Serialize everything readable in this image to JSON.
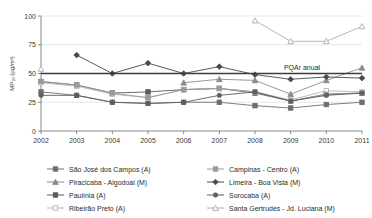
{
  "chart_data": {
    "type": "line",
    "title": "",
    "xlabel": "",
    "ylabel": "MP₁₀ (µg/m³)",
    "categories": [
      "2002",
      "2003",
      "2004",
      "2005",
      "2006",
      "2007",
      "2008",
      "2009",
      "2010",
      "2011"
    ],
    "x": [
      2002,
      2003,
      2004,
      2005,
      2006,
      2007,
      2008,
      2009,
      2010,
      2011
    ],
    "xlim": [
      2002,
      2011
    ],
    "ylim": [
      0,
      100
    ],
    "yticks": [
      0,
      25,
      50,
      75,
      100
    ],
    "xticks": [
      "2002",
      "2003",
      "2004",
      "2005",
      "2006",
      "2007",
      "2008",
      "2009",
      "2010",
      "2011"
    ],
    "grid": true,
    "legend_position": "bottom",
    "annotations": [
      {
        "text": "PQAr anual",
        "value": 50,
        "type": "horizontal-reference-line"
      }
    ],
    "series": [
      {
        "name": "São José dos Campos (A)",
        "marker": "square",
        "color": "#6e6e6e",
        "values": [
          34,
          31,
          25,
          24,
          25,
          25,
          22,
          20,
          23,
          25
        ]
      },
      {
        "name": "Piracicaba - Algodoal (M)",
        "marker": "triangle",
        "color": "#8c8c8c",
        "values": [
          null,
          null,
          null,
          null,
          42,
          45,
          44,
          32,
          44,
          55
        ]
      },
      {
        "name": "Paulínia (A)",
        "marker": "square",
        "color": "#5a5a5a",
        "values": [
          43,
          40,
          33,
          34,
          36,
          37,
          33,
          26,
          32,
          33
        ]
      },
      {
        "name": "Ribeirão Preto (A)",
        "marker": "square-open",
        "color": "#b5b5b5",
        "values": [
          42,
          39,
          32,
          29,
          36,
          37,
          34,
          27,
          35,
          34
        ]
      },
      {
        "name": "Campinas - Centro (A)",
        "marker": "square",
        "color": "#9a9a9a",
        "values": [
          43,
          40,
          33,
          29,
          36,
          37,
          34,
          26,
          32,
          33
        ]
      },
      {
        "name": "Limeira - Boa Vista (M)",
        "marker": "diamond",
        "color": "#4a4a4a",
        "values": [
          null,
          66,
          50,
          59,
          50,
          56,
          49,
          45,
          47,
          46
        ]
      },
      {
        "name": "Sorocaba (A)",
        "marker": "circle",
        "color": "#5f5f5f",
        "values": [
          31,
          31,
          25,
          24,
          25,
          31,
          34,
          26,
          31,
          33
        ]
      },
      {
        "name": "Santa Gertrudes - Jd. Luciana (M)",
        "marker": "triangle-open",
        "color": "#adadad",
        "values": [
          54,
          null,
          null,
          null,
          null,
          null,
          96,
          78,
          78,
          91
        ]
      }
    ]
  },
  "legend": {
    "items": [
      {
        "label": "São José dos Campos (A)",
        "marker": "square",
        "color": "#6e6e6e"
      },
      {
        "label": "Campinas - Centro (A)",
        "marker": "square",
        "color": "#9a9a9a"
      },
      {
        "label": "Piracicaba - Algodoal (M)",
        "marker": "triangle",
        "color": "#8c8c8c"
      },
      {
        "label": "Limeira - Boa Vista (M)",
        "marker": "diamond",
        "color": "#4a4a4a"
      },
      {
        "label": "Paulínia (A)",
        "marker": "square",
        "color": "#5a5a5a"
      },
      {
        "label": "Sorocaba (A)",
        "marker": "circle",
        "color": "#5f5f5f"
      },
      {
        "label": "Ribeirão Preto (A)",
        "marker": "square-open",
        "color": "#b5b5b5"
      },
      {
        "label": "Santa Gertrudes - Jd. Luciana (M)",
        "marker": "triangle-open",
        "color": "#adadad"
      }
    ]
  }
}
